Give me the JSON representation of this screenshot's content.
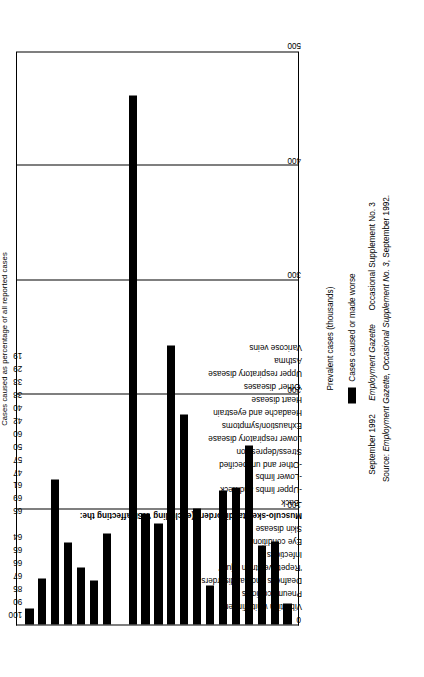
{
  "chart_data": {
    "type": "bar",
    "orientation": "horizontal",
    "title": "",
    "xlabel": "Prevalent cases (thousands)",
    "ylabel": "",
    "secondary_axis_label": "Cases caused as percentage of all reported cases",
    "xlim": [
      0,
      500
    ],
    "xticks": [
      0,
      100,
      200,
      300,
      400,
      500
    ],
    "grid": true,
    "legend": "Cases caused or made worse",
    "legend_position": "below-axis",
    "categories": [
      "Vibration white finger",
      "Pneumoconiosis",
      "Deafness and ear disorders",
      "'Repetitive strain injury'",
      "Infections",
      "Eye conditions",
      "Skin disease",
      "Musculo-skeletal disorders (excluding 'RSI' affecting the:",
      "-Back",
      "-Upper limbs and neck",
      "-Lower limbs",
      "-Other and unspecified",
      "Stress/depression",
      "Lower respiratory disease",
      "Exhaustion/symptoms",
      "Headache and eyestrain",
      "Heart disease",
      "'Other' diseases",
      "Upper respiratory disease",
      "Asthma",
      "Varicose veins"
    ],
    "values": [
      14,
      40,
      126,
      71,
      50,
      38,
      79,
      null,
      461,
      97,
      88,
      243,
      183,
      101,
      34,
      117,
      119,
      156,
      69,
      72,
      18
    ],
    "percentages": [
      "100",
      "90",
      "85",
      "67",
      "66",
      "65",
      "64",
      "",
      "65",
      "69",
      "61",
      "47",
      "57",
      "50",
      "60",
      "42",
      "40",
      "38",
      "33",
      "29",
      "19"
    ],
    "percent_axis_note": "Cases caused as percentage of all reported cases"
  },
  "footer": {
    "credit_date": "September 1992",
    "credit_publication": "Employment Gazette",
    "credit_supplement": "Occasional Supplement No. 3",
    "source_prefix": "Source: ",
    "source_italic": "Employment Gazette, Occasional Supplement No. 3",
    "source_tail": ", September 1992."
  }
}
